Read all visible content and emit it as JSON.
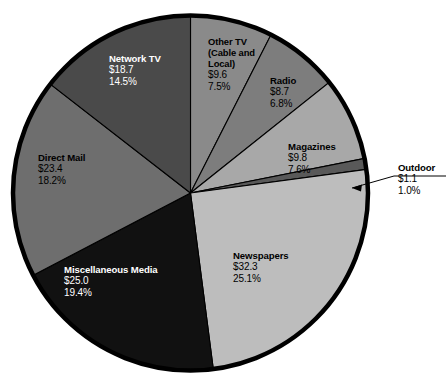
{
  "chart_data": {
    "type": "pie",
    "title": "",
    "subtitle": "",
    "legend_position": "none",
    "grid": false,
    "value_prefix": "$",
    "start_angle_deg": 0,
    "direction": "clockwise",
    "categories": [
      "Other TV (Cable and Local)",
      "Radio",
      "Magazines",
      "Outdoor",
      "Newspapers",
      "Miscellaneous Media",
      "Direct Mail",
      "Network TV"
    ],
    "values": [
      9.6,
      8.7,
      9.8,
      1.1,
      32.3,
      25.0,
      23.4,
      18.7
    ],
    "percents": [
      7.5,
      6.8,
      7.6,
      1.0,
      25.1,
      19.4,
      18.2,
      14.5
    ],
    "slices": [
      {
        "id": "other-tv",
        "name": "Other TV (Cable and Local)",
        "name_lines": [
          "Other TV",
          "(Cable and",
          "Local)"
        ],
        "value": "$9.6",
        "value_number": 9.6,
        "percent": "7.5%",
        "percent_number": 7.5,
        "color": "#8a8a8a",
        "text_color": "#000000",
        "label_placement": "inside"
      },
      {
        "id": "radio",
        "name": "Radio",
        "name_lines": [
          "Radio"
        ],
        "value": "$8.7",
        "value_number": 8.7,
        "percent": "6.8%",
        "percent_number": 6.8,
        "color": "#7d7d7d",
        "text_color": "#000000",
        "label_placement": "inside"
      },
      {
        "id": "magazines",
        "name": "Magazines",
        "name_lines": [
          "Magazines"
        ],
        "value": "$9.8",
        "value_number": 9.8,
        "percent": "7.6%",
        "percent_number": 7.6,
        "color": "#a8a8a8",
        "text_color": "#000000",
        "label_placement": "inside"
      },
      {
        "id": "outdoor",
        "name": "Outdoor",
        "name_lines": [
          "Outdoor"
        ],
        "value": "$1.1",
        "value_number": 1.1,
        "percent": "1.0%",
        "percent_number": 1.0,
        "color": "#595959",
        "text_color": "#000000",
        "label_placement": "outside-leader"
      },
      {
        "id": "newspapers",
        "name": "Newspapers",
        "name_lines": [
          "Newspapers"
        ],
        "value": "$32.3",
        "value_number": 32.3,
        "percent": "25.1%",
        "percent_number": 25.1,
        "color": "#bdbdbd",
        "text_color": "#000000",
        "label_placement": "inside"
      },
      {
        "id": "misc-media",
        "name": "Miscellaneous Media",
        "name_lines": [
          "Miscellaneous Media"
        ],
        "value": "$25.0",
        "value_number": 25.0,
        "percent": "19.4%",
        "percent_number": 19.4,
        "color": "#111111",
        "text_color": "#ffffff",
        "label_placement": "inside"
      },
      {
        "id": "direct-mail",
        "name": "Direct Mail",
        "name_lines": [
          "Direct Mail"
        ],
        "value": "$23.4",
        "value_number": 23.4,
        "percent": "18.2%",
        "percent_number": 18.2,
        "color": "#6e6e6e",
        "text_color": "#000000",
        "label_placement": "inside"
      },
      {
        "id": "network-tv",
        "name": "Network TV",
        "name_lines": [
          "Network TV"
        ],
        "value": "$18.7",
        "value_number": 18.7,
        "percent": "14.5%",
        "percent_number": 14.5,
        "color": "#4a4a4a",
        "text_color": "#ffffff",
        "label_placement": "inside"
      }
    ]
  },
  "labels": {
    "network_tv": {
      "name": "Network TV",
      "value": "$18.7",
      "percent": "14.5%"
    },
    "other_tv": {
      "line1": "Other TV",
      "line2": "(Cable and",
      "line3": "Local)",
      "value": "$9.6",
      "percent": "7.5%"
    },
    "radio": {
      "name": "Radio",
      "value": "$8.7",
      "percent": "6.8%"
    },
    "magazines": {
      "name": "Magazines",
      "value": "$9.8",
      "percent": "7.6%"
    },
    "outdoor": {
      "name": "Outdoor",
      "value": "$1.1",
      "percent": "1.0%"
    },
    "newspapers": {
      "name": "Newspapers",
      "value": "$32.3",
      "percent": "25.1%"
    },
    "misc_media": {
      "name": "Miscellaneous Media",
      "value": "$25.0",
      "percent": "19.4%"
    },
    "direct_mail": {
      "name": "Direct Mail",
      "value": "$23.4",
      "percent": "18.2%"
    }
  },
  "colors": {
    "background": "#ffffff",
    "outline": "#000000",
    "network_tv": "#4a4a4a",
    "other_tv": "#8a8a8a",
    "radio": "#7d7d7d",
    "magazines": "#a8a8a8",
    "outdoor": "#595959",
    "newspapers": "#bdbdbd",
    "misc_media": "#111111",
    "direct_mail": "#6e6e6e"
  }
}
